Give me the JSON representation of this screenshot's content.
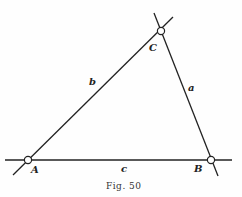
{
  "figure": {
    "caption": "Fig. 50",
    "vertices": [
      {
        "name": "A",
        "x": 28,
        "y": 160
      },
      {
        "name": "B",
        "x": 211,
        "y": 160
      },
      {
        "name": "C",
        "x": 161,
        "y": 31
      }
    ],
    "sides": [
      {
        "name": "a",
        "from": "B",
        "to": "C"
      },
      {
        "name": "b",
        "from": "A",
        "to": "C"
      },
      {
        "name": "c",
        "from": "A",
        "to": "B"
      }
    ],
    "labels": {
      "A": "A",
      "B": "B",
      "C": "C",
      "a": "a",
      "b": "b",
      "c": "c"
    },
    "colors": {
      "line": "#222222",
      "background": "#fefefe"
    }
  }
}
